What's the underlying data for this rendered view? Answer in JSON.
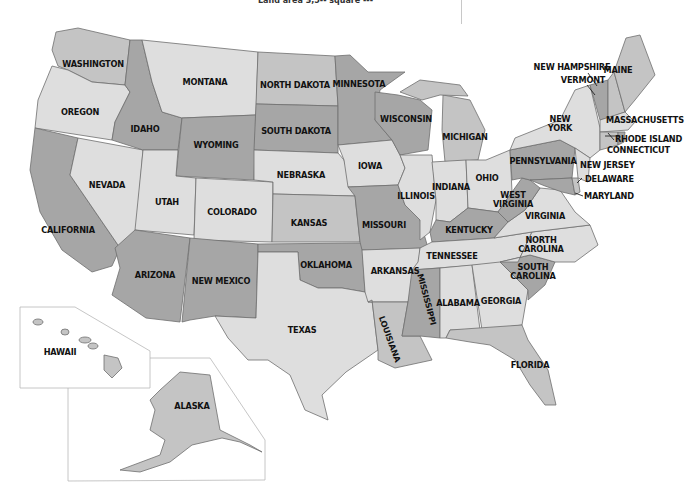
{
  "caption_fragment": "Land area  3,5-- square ---",
  "colors": {
    "light": "#dedede",
    "mid": "#c4c4c4",
    "dark": "#a6a6a6",
    "stroke": "#6e6e6e",
    "label": "#111111"
  },
  "states": {
    "washington": "WASHINGTON",
    "oregon": "OREGON",
    "california": "CALIFORNIA",
    "nevada": "NEVADA",
    "idaho": "IDAHO",
    "montana": "MONTANA",
    "wyoming": "WYOMING",
    "utah": "UTAH",
    "arizona": "ARIZONA",
    "colorado": "COLORADO",
    "new_mexico": "NEW MEXICO",
    "north_dakota": "NORTH DAKOTA",
    "south_dakota": "SOUTH DAKOTA",
    "nebraska": "NEBRASKA",
    "kansas": "KANSAS",
    "oklahoma": "OKLAHOMA",
    "texas": "TEXAS",
    "minnesota": "MINNESOTA",
    "iowa": "IOWA",
    "missouri": "MISSOURI",
    "arkansas": "ARKANSAS",
    "louisiana": "LOUISIANA",
    "wisconsin": "WISCONSIN",
    "illinois": "ILLINOIS",
    "michigan": "MICHIGAN",
    "indiana": "INDIANA",
    "ohio": "OHIO",
    "kentucky": "KENTUCKY",
    "tennessee": "TENNESSEE",
    "mississippi": "MISSISSIPPI",
    "alabama": "ALABAMA",
    "georgia": "GEORGIA",
    "florida": "FLORIDA",
    "south_carolina_1": "SOUTH",
    "south_carolina_2": "CAROLINA",
    "north_carolina_1": "NORTH",
    "north_carolina_2": "CAROLINA",
    "virginia": "VIRGINIA",
    "west_virginia_1": "WEST",
    "west_virginia_2": "VIRGINIA",
    "pennsylvania": "PENNSYLVANIA",
    "new_york_1": "NEW",
    "new_york_2": "YORK",
    "maine": "MAINE",
    "new_hampshire": "NEW HAMPSHIRE",
    "vermont": "VERMONT",
    "massachusetts": "MASSACHUSETTS",
    "rhode_island": "RHODE ISLAND",
    "connecticut": "CONNECTICUT",
    "new_jersey": "NEW JERSEY",
    "delaware": "DELAWARE",
    "maryland": "MARYLAND",
    "hawaii": "HAWAII",
    "alaska": "ALASKA"
  }
}
